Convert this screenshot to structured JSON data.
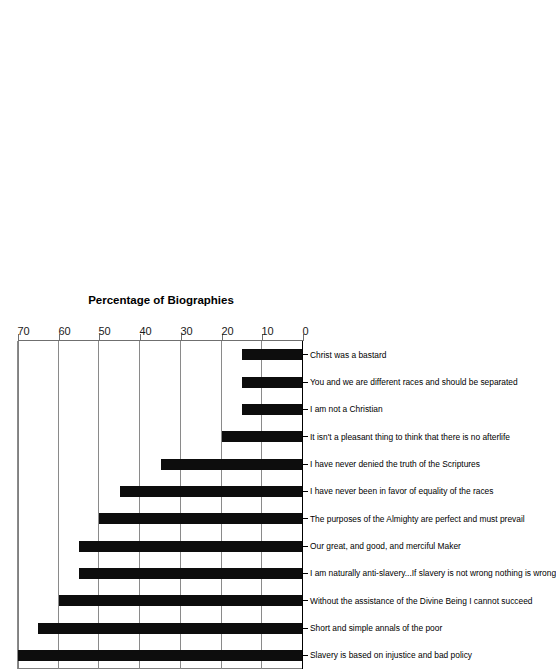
{
  "chart_data": {
    "type": "bar",
    "title": "",
    "subtitle": "",
    "orientation": "rotated-90ccw",
    "xlabel": "",
    "ylabel": "Percentage of Biographies",
    "ylim": [
      0,
      70
    ],
    "ytick_step": 10,
    "yticks": [
      0,
      10,
      20,
      30,
      40,
      50,
      60,
      70
    ],
    "ytick_labels": [
      "0",
      "10",
      "20",
      "30",
      "40",
      "50",
      "60",
      "70"
    ],
    "grid": true,
    "grid_axis": "value",
    "legend": false,
    "legend_position": "none",
    "bar_color": "#0d0d0d",
    "gridline_color": "#8a8a8a",
    "axis_color": "#6f6f6f",
    "categories": [
      "Slavery is based on injustice and bad policy",
      "Short and simple annals of the poor",
      "Without the assistance of the Divine Being I cannot succeed",
      "I am naturally anti-slavery...If slavery is not wrong nothing is wrong",
      "Our great, and good, and merciful Maker",
      "The purposes of the Almighty are perfect and must prevail",
      "I have never been in favor of equality of the races",
      "I have never denied the truth of the Scriptures",
      "It isn't a pleasant thing to think that there is no afterlife",
      "I am not a Christian",
      "You and we are different races and should be separated",
      "Christ was a bastard"
    ],
    "values": [
      70,
      65,
      60,
      55,
      55,
      50,
      45,
      35,
      20,
      15,
      15,
      15
    ]
  }
}
